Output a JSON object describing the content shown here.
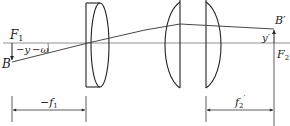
{
  "diagram": {
    "type": "optical-system",
    "labels": {
      "F1": "F",
      "F1_sub": "1",
      "B": "B",
      "minus_y": "−y",
      "minus_omega": "−ω",
      "B_prime": "B′",
      "y_prime": "y′",
      "F2_prime": "F",
      "F2_prime_sub": "2",
      "F2_prime_mark": "′",
      "minus_f1": "−f",
      "minus_f1_sub": "1",
      "f2_prime": "f",
      "f2_prime_sub": "2",
      "f2_prime_mark": "′"
    },
    "colors": {
      "line": "#333333",
      "axis": "#666666",
      "background": "#ffffff"
    }
  }
}
